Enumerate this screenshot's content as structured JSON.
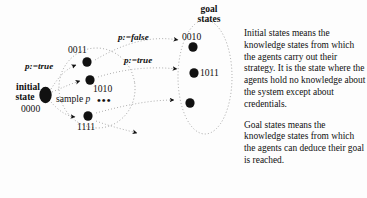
{
  "figure": {
    "background_color": "#fdfdfd",
    "ink_color": "#111111",
    "type": "state-transition-diagram"
  },
  "diagram": {
    "initial_state": {
      "label_line1": "initial",
      "label_line2": "state",
      "bits": "0000"
    },
    "sample_region": {
      "label": "sample",
      "label_italic_var": "p",
      "ellipsis": "•••",
      "nodes": [
        {
          "bits": "0011"
        },
        {
          "bits": "1010"
        },
        {
          "bits": "1111"
        }
      ]
    },
    "goal_region": {
      "title_line1": "goal",
      "title_line2": "states",
      "nodes": [
        {
          "bits": "0010"
        },
        {
          "bits": "1011"
        },
        {
          "bits": ""
        }
      ]
    },
    "edge_labels": [
      {
        "text": "p:=true"
      },
      {
        "text": "p:=false"
      },
      {
        "text": "p:=true"
      }
    ]
  },
  "explanation": {
    "paragraph_1": "Initial states means the knowledge states from which the agents carry out their strategy. It is the state where the agents hold no knowledge about the system except about credentials.",
    "paragraph_2": "Goal states means the knowledge states from which the agents can deduce their goal is reached."
  }
}
